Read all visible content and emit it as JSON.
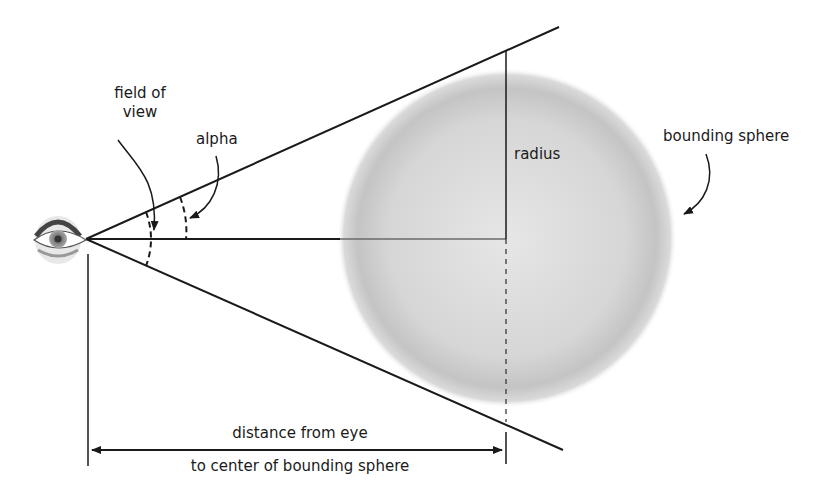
{
  "labels": {
    "field_of_view_line1": "field of",
    "field_of_view_line2": "view",
    "alpha": "alpha",
    "radius": "radius",
    "bounding_sphere": "bounding sphere",
    "distance_line1": "distance from eye",
    "distance_line2": "to center of bounding sphere"
  },
  "colors": {
    "line": "#1a1a1a",
    "sphere_center": "#e4e4e4",
    "sphere_edge": "#b8b8b8",
    "background": "#ffffff"
  },
  "icons": {
    "eye": "eye-icon"
  }
}
